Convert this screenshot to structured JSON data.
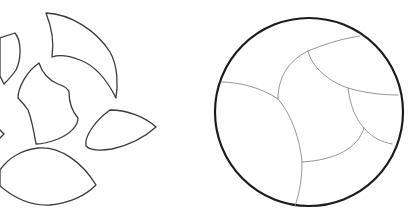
{
  "diagram": {
    "type": "puzzle-assembly",
    "colors": {
      "background": "#ffffff",
      "piece_outline": "#3a3a3a",
      "circle_outline": "#1c1c1c",
      "seam_lines": "#8a8a8a"
    },
    "scattered": {
      "label": "Scattered pieces",
      "piece_count_visible": 7,
      "pieces": [
        {
          "id": "piece-top-left-fragment",
          "label": "Partial piece at left edge (top)"
        },
        {
          "id": "piece-crescent",
          "label": "Large crescent piece"
        },
        {
          "id": "piece-center-irregular",
          "label": "Central irregular piece"
        },
        {
          "id": "piece-left-edge-small",
          "label": "Tiny fragment at left edge"
        },
        {
          "id": "piece-right-teardrop",
          "label": "Right teardrop piece"
        },
        {
          "id": "piece-bottom-lens",
          "label": "Bottom lens-shaped piece"
        }
      ]
    },
    "assembled": {
      "label": "Assembled circle",
      "shape": "circle",
      "regions": 7
    }
  }
}
